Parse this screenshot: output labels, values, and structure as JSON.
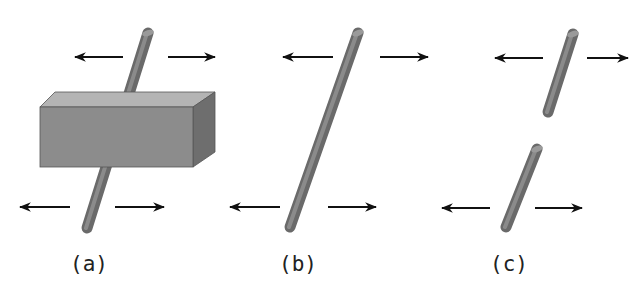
{
  "figure": {
    "panels": [
      {
        "id": "a",
        "label": "(a)",
        "description": "rod passing through a block, pulled apart by opposing forces"
      },
      {
        "id": "b",
        "label": "(b)",
        "description": "single intact rod, pulled apart by opposing forces"
      },
      {
        "id": "c",
        "label": "(c)",
        "description": "rod broken into two pieces under opposing forces"
      }
    ],
    "colors": {
      "background": "#ffffff",
      "rod": "#7a7a7a",
      "rod_highlight": "#b8b8b8",
      "block_front": "#8c8c8c",
      "block_top": "#b4b4b4",
      "block_side": "#6e6e6e",
      "arrow": "#111111",
      "label": "#222222"
    }
  }
}
